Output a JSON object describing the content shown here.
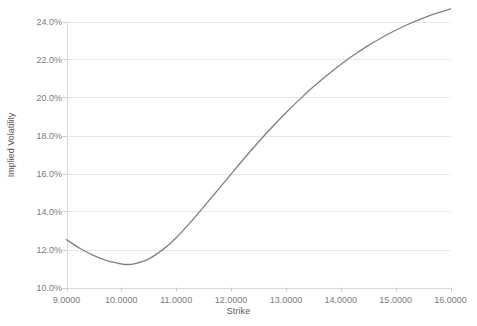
{
  "chart_data": {
    "type": "line",
    "title": "",
    "xlabel": "Strike",
    "ylabel": "Implied Volatility",
    "xlim": [
      9.0,
      16.0
    ],
    "ylim": [
      0.1,
      0.24
    ],
    "grid": true,
    "legend": null,
    "legend_position": "none",
    "line_color": "#808080",
    "gridline_color": "#e8e8e8",
    "axis_text_color": "#7b7b7b",
    "background_color": "#ffffff",
    "x_tick_labels": [
      "9.0000",
      "10.0000",
      "11.0000",
      "12.0000",
      "13.0000",
      "14.0000",
      "15.0000",
      "16.0000"
    ],
    "x_tick_values": [
      9.0,
      10.0,
      11.0,
      12.0,
      13.0,
      14.0,
      15.0,
      16.0
    ],
    "y_tick_labels": [
      "10.0%",
      "12.0%",
      "14.0%",
      "16.0%",
      "18.0%",
      "20.0%",
      "22.0%",
      "24.0%"
    ],
    "y_tick_values": [
      0.1,
      0.12,
      0.14,
      0.16,
      0.18,
      0.2,
      0.22,
      0.24
    ],
    "series": [
      {
        "name": "Implied Volatility",
        "x": [
          9.0,
          9.25,
          9.5,
          9.75,
          10.0,
          10.1,
          10.25,
          10.5,
          10.75,
          11.0,
          11.25,
          11.5,
          11.75,
          12.0,
          12.25,
          12.5,
          12.75,
          13.0,
          13.25,
          13.5,
          13.75,
          14.0,
          14.25,
          14.5,
          14.75,
          15.0,
          15.25,
          15.5,
          15.75,
          16.0
        ],
        "values": [
          0.1252,
          0.1205,
          0.1168,
          0.114,
          0.1124,
          0.1121,
          0.1126,
          0.1151,
          0.1198,
          0.1262,
          0.134,
          0.1424,
          0.151,
          0.1597,
          0.1683,
          0.1766,
          0.1845,
          0.192,
          0.199,
          0.2056,
          0.2117,
          0.2174,
          0.2226,
          0.2273,
          0.2316,
          0.2354,
          0.2388,
          0.2418,
          0.2444,
          0.2466
        ]
      }
    ]
  }
}
